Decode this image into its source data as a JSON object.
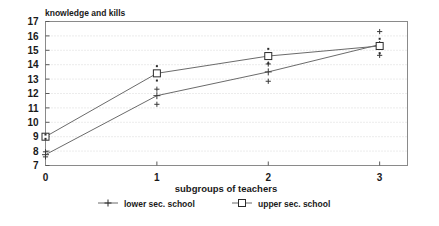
{
  "chart_data": {
    "type": "line",
    "title": "knowledge and kills",
    "xlabel": "subgroups of teachers",
    "ylabel": "",
    "x": [
      0,
      1,
      2,
      3
    ],
    "xticklabels": [
      "0",
      "1",
      "2",
      "3"
    ],
    "yticklabels": [
      "7",
      "8",
      "9",
      "10",
      "11",
      "12",
      "13",
      "14",
      "15",
      "16",
      "17"
    ],
    "xlim": [
      0,
      3.25
    ],
    "ylim": [
      7,
      17
    ],
    "grid": true,
    "legend_position": "bottom",
    "series": [
      {
        "name": "lower sec. school",
        "marker": "plus",
        "values": [
          7.75,
          11.85,
          13.5,
          15.4
        ],
        "error_upper": [
          7.95,
          12.3,
          14.05,
          16.3
        ],
        "error_lower": [
          7.6,
          11.25,
          12.85,
          14.65
        ]
      },
      {
        "name": "upper sec. school",
        "marker": "open-square",
        "values": [
          9.0,
          13.4,
          14.6,
          15.3
        ],
        "error_upper": [
          9.15,
          13.9,
          15.1,
          15.8
        ],
        "error_lower": [
          8.85,
          12.9,
          14.1,
          14.8
        ]
      }
    ]
  },
  "legend": {
    "items": [
      {
        "label": "lower sec. school"
      },
      {
        "label": "upper sec. school"
      }
    ]
  }
}
